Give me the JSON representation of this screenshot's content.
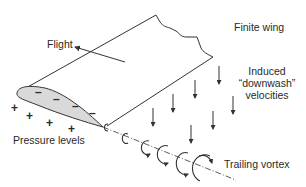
{
  "diagram": {
    "labels": {
      "flight": "Flight",
      "finite_wing": "Finite wing",
      "downwash_line1": "Induced",
      "downwash_line2": "“downwash”",
      "downwash_line3": "velocities",
      "pressure_levels": "Pressure levels",
      "trailing_vortex": "Trailing vortex"
    },
    "signs": {
      "upper": [
        "–",
        "–",
        "–",
        "–"
      ],
      "lower": [
        "+",
        "+",
        "+",
        "+"
      ]
    },
    "colors": {
      "line": "#333333",
      "airfoil_fill": "#d9d9d9",
      "background": "#ffffff"
    },
    "elements": [
      "wing-planform",
      "airfoil-section",
      "flight-direction-arrow",
      "downwash-arrows",
      "trailing-vortex-swirls",
      "vortex-axis-line"
    ]
  }
}
